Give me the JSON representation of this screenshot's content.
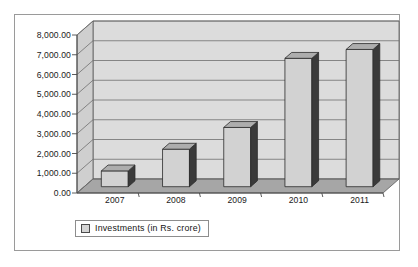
{
  "chart_data": {
    "type": "bar",
    "title": "",
    "subtitle": "",
    "xlabel": "",
    "ylabel": "",
    "categories": [
      "2007",
      "2008",
      "2009",
      "2010",
      "2011"
    ],
    "series": [
      {
        "name": "Investments (in Rs. crore)",
        "values": [
          800,
          1900,
          3000,
          6500,
          6950
        ]
      }
    ],
    "ylim": [
      0,
      8000
    ],
    "ytick_labels": [
      "0.00",
      "1,000.00",
      "2,000.00",
      "3,000.00",
      "4,000.00",
      "5,000.00",
      "6,000.00",
      "7,000.00",
      "8,000.00"
    ],
    "ytick_values": [
      0,
      1000,
      2000,
      3000,
      4000,
      5000,
      6000,
      7000,
      8000
    ],
    "grid": true,
    "grid_axis": "y",
    "style": "3d-column",
    "legend": {
      "position": "bottom",
      "entries": [
        {
          "label": "Investments (in Rs. crore)",
          "swatch_icon": "square-swatch-icon"
        }
      ]
    },
    "colors": {
      "bar_front": "#d2d2d2",
      "bar_side": "#3a3a3a",
      "bar_top": "#adadad",
      "wall_back": "#dcdcdc",
      "wall_left": "#cfcfcf",
      "floor": "#a6a6a6",
      "grid_line": "#6e6e6e",
      "axis_line": "#4a4a4a",
      "frame_border": "#9a9a9a",
      "text": "#1a1a1a",
      "background": "#ffffff"
    }
  },
  "legend": {
    "label": "Investments (in Rs. crore)"
  }
}
